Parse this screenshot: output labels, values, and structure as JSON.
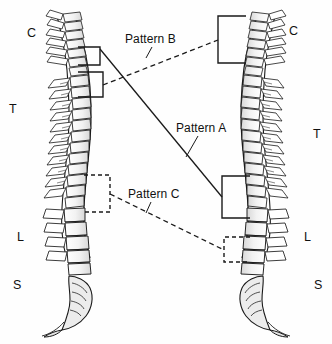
{
  "figure": {
    "background_color": "#fefefe",
    "ink_color": "#111111",
    "width": 332,
    "height": 344
  },
  "spines": [
    {
      "id": "left-spine",
      "orientation": "facing-left",
      "description": "Lateral view of vertebral column, anterior to the right",
      "region_labels": [
        {
          "key": "C",
          "label": "C",
          "meaning": "cervical",
          "x": 27,
          "y": 27
        },
        {
          "key": "T",
          "label": "T",
          "meaning": "thoracic",
          "x": 9,
          "y": 103
        },
        {
          "key": "L",
          "label": "L",
          "meaning": "lumbar",
          "x": 17,
          "y": 231
        },
        {
          "key": "S",
          "label": "S",
          "meaning": "sacral",
          "x": 13,
          "y": 279
        }
      ]
    },
    {
      "id": "right-spine",
      "orientation": "facing-right",
      "description": "Mirrored lateral view of vertebral column, anterior to the left",
      "region_labels": [
        {
          "key": "C",
          "label": "C",
          "meaning": "cervical",
          "x": 289,
          "y": 25
        },
        {
          "key": "T",
          "label": "T",
          "meaning": "thoracic",
          "x": 313,
          "y": 128
        },
        {
          "key": "L",
          "label": "L",
          "meaning": "lumbar",
          "x": 304,
          "y": 231
        },
        {
          "key": "S",
          "label": "S",
          "meaning": "sacral",
          "x": 314,
          "y": 279
        }
      ]
    }
  ],
  "annotations": [
    {
      "id": "pattern-b",
      "label": "Pattern B",
      "label_x": 125,
      "label_y": 33,
      "line_style": "dashed",
      "leader": {
        "from_x": 152,
        "from_y": 47,
        "to_x": 146,
        "to_y": 58
      },
      "connects": "left upper-thoracic bracket to right cervicothoracic bracket"
    },
    {
      "id": "pattern-a",
      "label": "Pattern A",
      "label_x": 176,
      "label_y": 122,
      "line_style": "solid",
      "leader": {
        "from_x": 198,
        "from_y": 136,
        "to_x": 186,
        "to_y": 157
      },
      "connects": "left upper bracket to right thoracolumbar bracket"
    },
    {
      "id": "pattern-c",
      "label": "Pattern C",
      "label_x": 128,
      "label_y": 188,
      "line_style": "dashed",
      "leader": {
        "from_x": 151,
        "from_y": 202,
        "to_x": 146,
        "to_y": 213
      },
      "connects": "left thoracolumbar dashed bracket to right lumbosacral dashed bracket"
    }
  ],
  "brackets": [
    {
      "id": "left-bracket-upper",
      "style": "solid",
      "side": "left",
      "x_outer": 78,
      "x_inner": 100,
      "y_top": 47,
      "y_bottom": 65
    },
    {
      "id": "left-bracket-lower",
      "style": "solid",
      "side": "left",
      "x_outer": 78,
      "x_inner": 103,
      "y_top": 72,
      "y_bottom": 97
    },
    {
      "id": "left-bracket-dashed",
      "style": "dashed",
      "side": "left",
      "x_outer": 84,
      "x_inner": 110,
      "y_top": 175,
      "y_bottom": 212
    },
    {
      "id": "right-bracket-cervicothoracic",
      "style": "solid",
      "side": "right",
      "x_outer": 246,
      "x_inner": 218,
      "y_top": 16,
      "y_bottom": 63
    },
    {
      "id": "right-bracket-thoracolumbar",
      "style": "solid",
      "side": "right",
      "x_outer": 250,
      "x_inner": 222,
      "y_top": 176,
      "y_bottom": 218
    },
    {
      "id": "right-bracket-lumbosacral",
      "style": "dashed",
      "side": "right",
      "x_outer": 250,
      "x_inner": 224,
      "y_top": 237,
      "y_bottom": 262
    }
  ],
  "connector_lines": [
    {
      "id": "connector-pattern-b",
      "style": "dashed",
      "x1": 103,
      "y1": 85,
      "x2": 218,
      "y2": 40
    },
    {
      "id": "connector-pattern-a",
      "style": "solid",
      "x1": 100,
      "y1": 49,
      "x2": 222,
      "y2": 197
    },
    {
      "id": "connector-pattern-c",
      "style": "dashed",
      "x1": 110,
      "y1": 194,
      "x2": 224,
      "y2": 250
    }
  ]
}
